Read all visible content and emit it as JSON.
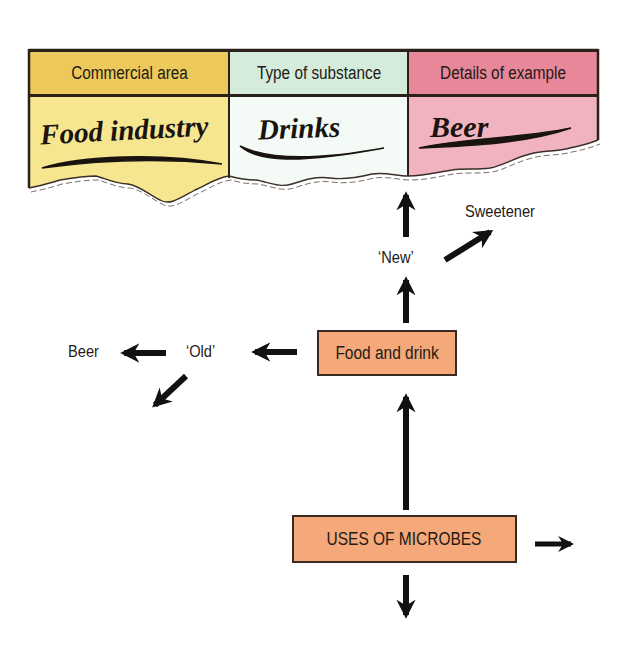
{
  "table": {
    "columns": [
      {
        "header": "Commercial area",
        "value": "Food industry",
        "header_color": "#ecc95a",
        "body_color": "#f6e690"
      },
      {
        "header": "Type of substance",
        "value": "Drinks",
        "header_color": "#d5ecdc",
        "body_color": "#f4fbf6"
      },
      {
        "header": "Details of example",
        "value": "Beer",
        "header_color": "#e8869a",
        "body_color": "#f2b3c0"
      }
    ]
  },
  "nodes": {
    "root": "USES OF MICROBES",
    "food_and_drink": "Food and drink",
    "new": "‘New’",
    "old": "‘Old’",
    "sweetener": "Sweetener",
    "beer": "Beer"
  },
  "colors": {
    "box_fill": "#f5a97a",
    "arrow": "#111111"
  }
}
